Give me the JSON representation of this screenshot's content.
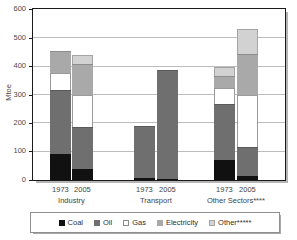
{
  "chart_data": {
    "type": "bar",
    "title": "",
    "subtitle": "",
    "xlabel": "",
    "ylabel": "Mtoe",
    "ylim": [
      0,
      600
    ],
    "yticks": [
      0,
      100,
      200,
      300,
      400,
      500,
      600
    ],
    "ytick_labels": [
      "0",
      "100",
      "200",
      "300",
      "400",
      "500",
      "600"
    ],
    "grid": true,
    "stacked": true,
    "legend_position": "bottom",
    "legend_entries": [
      "Coal",
      "Oil",
      "Gas",
      "Electricity",
      "Other*****"
    ],
    "group_labels": [
      "Industry",
      "Transport",
      "Other Sectors****"
    ],
    "categories": [
      "1973",
      "2005",
      "1973",
      "2005",
      "1973",
      "2005"
    ],
    "series": [
      {
        "name": "Coal",
        "color": "#111111",
        "values": [
          90,
          38,
          6,
          4,
          72,
          13
        ]
      },
      {
        "name": "Oil",
        "color": "#6f6f6f",
        "values": [
          228,
          148,
          185,
          383,
          195,
          105
        ]
      },
      {
        "name": "Gas",
        "color": "#ffffff",
        "values": [
          58,
          115,
          0,
          0,
          56,
          182
        ]
      },
      {
        "name": "Electricity",
        "color": "#a9a9a9",
        "values": [
          78,
          108,
          0,
          0,
          42,
          145
        ]
      },
      {
        "name": "Other*****",
        "color": "#d2d2d2",
        "values": [
          0,
          31,
          0,
          0,
          33,
          87
        ]
      }
    ],
    "totals": [
      454,
      440,
      191,
      387,
      398,
      532
    ]
  },
  "axis": {
    "y_title": "Mtoe"
  },
  "groups": [
    {
      "label": "Industry",
      "years": [
        "1973",
        "2005"
      ]
    },
    {
      "label": "Transport",
      "years": [
        "1973",
        "2005"
      ]
    },
    {
      "label": "Other Sectors****",
      "years": [
        "1973",
        "2005"
      ]
    }
  ],
  "legend": {
    "items": [
      {
        "label": "Coal",
        "key": "coal"
      },
      {
        "label": "Oil",
        "key": "oil"
      },
      {
        "label": "Gas",
        "key": "gas"
      },
      {
        "label": "Electricity",
        "key": "elec"
      },
      {
        "label": "Other*****",
        "key": "other"
      }
    ]
  }
}
